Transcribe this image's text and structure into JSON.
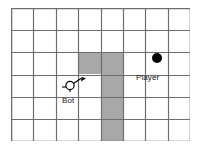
{
  "diagram": {
    "canvas": {
      "width": 201,
      "height": 149,
      "background": "#ffffff"
    },
    "grid": {
      "columns": 8,
      "rows": 6,
      "line_color": "#6e6e6e",
      "border_color": "#6e6e6e",
      "cell_fill": "#ffffff",
      "shaded_fill": "#a8a8a8",
      "origin_x": 11,
      "origin_y": 8,
      "width": 179,
      "height": 133,
      "shaded_cells": [
        {
          "col": 4,
          "row": 3
        },
        {
          "col": 5,
          "row": 3
        },
        {
          "col": 5,
          "row": 4
        },
        {
          "col": 5,
          "row": 5
        },
        {
          "col": 5,
          "row": 6
        }
      ]
    },
    "markers": [
      {
        "id": "bot",
        "label": "Bot",
        "icon": "circle-with-direction-arrow",
        "fill": "#ffffff",
        "stroke": "#000000",
        "col": 4,
        "row": 4,
        "heading": "upper-right"
      },
      {
        "id": "player",
        "label": "Player",
        "icon": "filled-circle",
        "fill": "#000000",
        "stroke": "#000000",
        "col": 7,
        "row": 3
      }
    ]
  }
}
